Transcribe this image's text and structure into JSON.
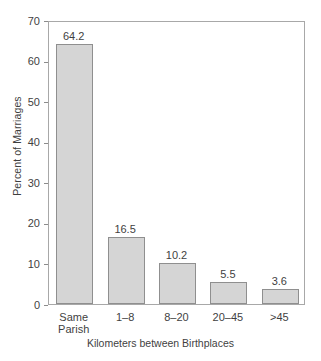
{
  "chart_data": {
    "type": "bar",
    "title": "",
    "xlabel": "Kilometers between Birthplaces",
    "ylabel": "Percent of Marriages",
    "categories": [
      "Same\nParish",
      "1–8",
      "8–20",
      "20–45",
      ">45"
    ],
    "values": [
      64.2,
      16.5,
      10.2,
      5.5,
      3.6
    ],
    "value_labels": [
      "64.2",
      "16.5",
      "10.2",
      "5.5",
      "3.6"
    ],
    "ylim": [
      0,
      70
    ],
    "yticks": [
      0,
      10,
      20,
      30,
      40,
      50,
      60,
      70
    ],
    "ytick_labels": [
      "0",
      "10",
      "20",
      "30",
      "40",
      "50",
      "60",
      "70"
    ],
    "grid": false,
    "legend": false,
    "bar_fill_color": "#d5d5d5",
    "bar_edge_color": "#8f8f8f",
    "axis_color": "#a8a8a8",
    "text_color": "#3f3f3f"
  }
}
